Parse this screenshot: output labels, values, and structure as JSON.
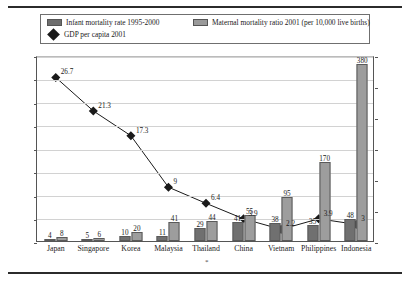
{
  "legend": {
    "items": [
      {
        "label": "Infant mortality rate 1995-2000",
        "marker": "bar-dark-swatch"
      },
      {
        "label": "Maternal mortality ratio 2001 (per 10,000 live births)",
        "marker": "bar-light-swatch"
      },
      {
        "label": "GDP per capita 2001",
        "marker": "diamond-marker"
      }
    ]
  },
  "chart_data": {
    "type": "bar",
    "title": "",
    "xlabel": "",
    "ylabel": "",
    "y2label": "",
    "grid": true,
    "legend_position": "top",
    "categories": [
      "Japan",
      "Singapore",
      "Korea",
      "Malaysia",
      "Thailand",
      "China",
      "Vietnam",
      "Philippines",
      "Indonesia"
    ],
    "ylim": [
      0,
      400
    ],
    "yticks": [
      0,
      50,
      100,
      150,
      200,
      250,
      300,
      350,
      400
    ],
    "y2lim": [
      0,
      30
    ],
    "y2ticks": [
      0,
      5,
      10,
      15,
      20,
      25,
      30
    ],
    "series": [
      {
        "name": "Infant mortality rate 1995-2000",
        "type": "bar",
        "axis": "left",
        "color": "#707070",
        "values": [
          4,
          5,
          10,
          11,
          29,
          41,
          38,
          35,
          48
        ]
      },
      {
        "name": "Maternal mortality ratio 2001 (per 10,000 live births)",
        "type": "bar",
        "axis": "left",
        "color": "#9d9d9d",
        "values": [
          8,
          6,
          20,
          41,
          44,
          55,
          95,
          170,
          380
        ]
      },
      {
        "name": "GDP per capita 2001",
        "type": "line",
        "axis": "right",
        "color": "#1a1a1a",
        "marker": "diamond",
        "values": [
          26.7,
          21.3,
          17.3,
          9,
          6.4,
          3.9,
          2.2,
          3.9,
          3
        ]
      }
    ]
  },
  "colors": {
    "infant_bar": "#707070",
    "maternal_bar": "#9d9d9d",
    "gdp_line": "#1a1a1a",
    "grid": "#d2d2d2",
    "axis": "#555555",
    "background": "#ffffff"
  },
  "footnote": "*"
}
